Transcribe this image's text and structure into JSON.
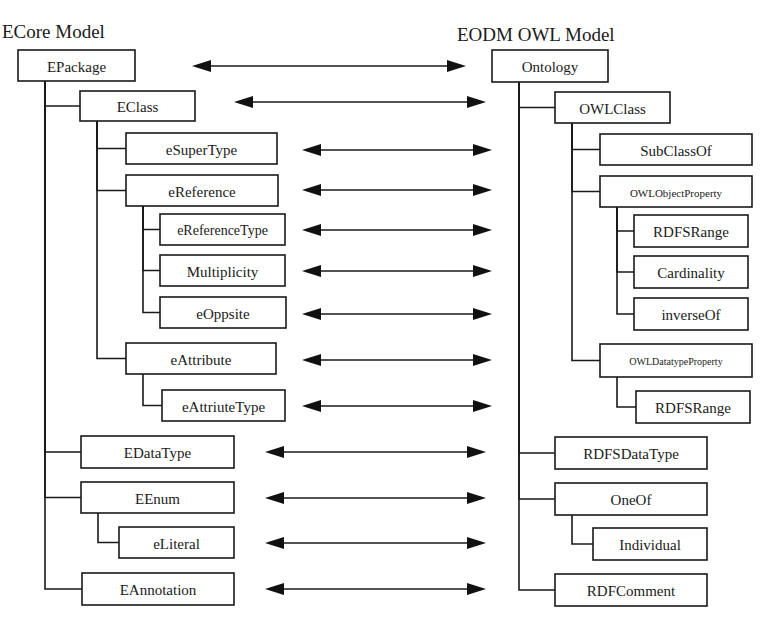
{
  "diagram": {
    "left_title": "ECore Model",
    "right_title": "EODM OWL Model",
    "colors": {
      "ink": "#1a1a1a",
      "background": "#ffffff"
    },
    "left_nodes": [
      {
        "id": "epackage",
        "label": "EPackage",
        "x": 18,
        "y": 50,
        "w": 117,
        "h": 31,
        "fs": 15,
        "parent": null
      },
      {
        "id": "eclass",
        "label": "EClass",
        "x": 80,
        "y": 91,
        "w": 115,
        "h": 30,
        "fs": 15,
        "parent": "epackage"
      },
      {
        "id": "esupertype",
        "label": "eSuperType",
        "x": 126,
        "y": 133,
        "w": 151,
        "h": 31,
        "fs": 15,
        "parent": "eclass"
      },
      {
        "id": "ereference",
        "label": "eReference",
        "x": 126,
        "y": 175,
        "w": 152,
        "h": 31,
        "fs": 15,
        "parent": "eclass"
      },
      {
        "id": "ereferencetype",
        "label": "eReferenceType",
        "x": 160,
        "y": 214,
        "w": 125,
        "h": 31,
        "fs": 14,
        "parent": "ereference"
      },
      {
        "id": "multiplicity",
        "label": "Multiplicity",
        "x": 160,
        "y": 255,
        "w": 125,
        "h": 31,
        "fs": 15,
        "parent": "ereference"
      },
      {
        "id": "eoppsite",
        "label": "eOppsite",
        "x": 160,
        "y": 297,
        "w": 126,
        "h": 31,
        "fs": 15,
        "parent": "ereference"
      },
      {
        "id": "eattribute",
        "label": "eAttribute",
        "x": 126,
        "y": 343,
        "w": 150,
        "h": 31,
        "fs": 15,
        "parent": "eclass"
      },
      {
        "id": "eattriutetype",
        "label": "eAttriuteType",
        "x": 162,
        "y": 390,
        "w": 123,
        "h": 31,
        "fs": 15,
        "parent": "eattribute"
      },
      {
        "id": "edatatype",
        "label": "EDataType",
        "x": 81,
        "y": 436,
        "w": 153,
        "h": 32,
        "fs": 15,
        "parent": "epackage"
      },
      {
        "id": "eenum",
        "label": "EEnum",
        "x": 81,
        "y": 482,
        "w": 153,
        "h": 31,
        "fs": 15,
        "parent": "epackage"
      },
      {
        "id": "eliteral",
        "label": "eLiteral",
        "x": 119,
        "y": 527,
        "w": 115,
        "h": 31,
        "fs": 15,
        "parent": "eenum"
      },
      {
        "id": "eannotation",
        "label": "EAnnotation",
        "x": 82,
        "y": 573,
        "w": 152,
        "h": 32,
        "fs": 15,
        "parent": "epackage"
      }
    ],
    "right_nodes": [
      {
        "id": "ontology",
        "label": "Ontology",
        "x": 492,
        "y": 50,
        "w": 116,
        "h": 32,
        "fs": 15,
        "parent": null
      },
      {
        "id": "owlclass",
        "label": "OWLClass",
        "x": 555,
        "y": 92,
        "w": 115,
        "h": 31,
        "fs": 15,
        "parent": "ontology"
      },
      {
        "id": "subclassof",
        "label": "SubClassOf",
        "x": 600,
        "y": 134,
        "w": 152,
        "h": 31,
        "fs": 15,
        "parent": "owlclass"
      },
      {
        "id": "owlobjectproperty",
        "label": "OWLObjectProperty",
        "x": 600,
        "y": 176,
        "w": 152,
        "h": 31,
        "fs": 11,
        "parent": "owlclass"
      },
      {
        "id": "rdfsrange1",
        "label": "RDFSRange",
        "x": 634,
        "y": 215,
        "w": 114,
        "h": 32,
        "fs": 15,
        "parent": "owlobjectproperty"
      },
      {
        "id": "cardinality",
        "label": "Cardinality",
        "x": 634,
        "y": 256,
        "w": 114,
        "h": 32,
        "fs": 15,
        "parent": "owlobjectproperty"
      },
      {
        "id": "inverseof",
        "label": "inverseOf",
        "x": 634,
        "y": 298,
        "w": 114,
        "h": 32,
        "fs": 15,
        "parent": "owlobjectproperty"
      },
      {
        "id": "owldatatypeproperty",
        "label": "OWLDatatypeProperty",
        "x": 600,
        "y": 344,
        "w": 152,
        "h": 33,
        "fs": 10,
        "parent": "owlclass"
      },
      {
        "id": "rdfsrange2",
        "label": "RDFSRange",
        "x": 636,
        "y": 391,
        "w": 114,
        "h": 32,
        "fs": 15,
        "parent": "owldatatypeproperty"
      },
      {
        "id": "rdfsdatatype",
        "label": "RDFSDataType",
        "x": 555,
        "y": 437,
        "w": 152,
        "h": 32,
        "fs": 15,
        "parent": "ontology"
      },
      {
        "id": "oneof",
        "label": "OneOf",
        "x": 555,
        "y": 483,
        "w": 152,
        "h": 32,
        "fs": 15,
        "parent": "ontology"
      },
      {
        "id": "individual",
        "label": "Individual",
        "x": 593,
        "y": 528,
        "w": 114,
        "h": 32,
        "fs": 15,
        "parent": "oneof"
      },
      {
        "id": "rdfcomment",
        "label": "RDFComment",
        "x": 555,
        "y": 574,
        "w": 152,
        "h": 32,
        "fs": 15,
        "parent": "ontology"
      }
    ],
    "mappings": [
      {
        "from": "EPackage",
        "to": "Ontology",
        "x1": 192,
        "x2": 466,
        "y": 66
      },
      {
        "from": "EClass",
        "to": "OWLClass",
        "x1": 234,
        "x2": 486,
        "y": 102
      },
      {
        "from": "eSuperType",
        "to": "SubClassOf",
        "x1": 302,
        "x2": 492,
        "y": 150
      },
      {
        "from": "eReference",
        "to": "OWLObjectProperty",
        "x1": 302,
        "x2": 492,
        "y": 190
      },
      {
        "from": "eReferenceType",
        "to": "RDFSRange",
        "x1": 302,
        "x2": 492,
        "y": 230
      },
      {
        "from": "Multiplicity",
        "to": "Cardinality",
        "x1": 302,
        "x2": 492,
        "y": 271
      },
      {
        "from": "eOppsite",
        "to": "inverseOf",
        "x1": 302,
        "x2": 492,
        "y": 314
      },
      {
        "from": "eAttribute",
        "to": "OWLDatatypeProperty",
        "x1": 302,
        "x2": 492,
        "y": 360
      },
      {
        "from": "eAttriuteType",
        "to": "RDFSRange",
        "x1": 302,
        "x2": 492,
        "y": 406
      },
      {
        "from": "EDataType",
        "to": "RDFSDataType",
        "x1": 265,
        "x2": 486,
        "y": 452
      },
      {
        "from": "EEnum",
        "to": "OneOf",
        "x1": 265,
        "x2": 486,
        "y": 498
      },
      {
        "from": "eLiteral",
        "to": "Individual",
        "x1": 265,
        "x2": 486,
        "y": 543
      },
      {
        "from": "EAnnotation",
        "to": "RDFComment",
        "x1": 265,
        "x2": 486,
        "y": 589
      }
    ]
  }
}
